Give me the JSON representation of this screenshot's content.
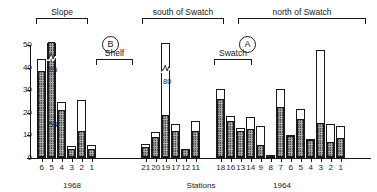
{
  "axes": {
    "ylabel": "× 10³ m⁻²",
    "ylabel_parts": {
      "mult": "×",
      "base": "10",
      "exp": "3",
      "unit": "m",
      "unit_exp": "-2"
    },
    "yticks": [
      0,
      10,
      20,
      30,
      40,
      50
    ],
    "ylim": [
      0,
      50
    ],
    "xlabel": "Stations"
  },
  "era_labels": [
    {
      "text": "1968",
      "x": 72
    },
    {
      "text": "1964",
      "x": 282
    }
  ],
  "panel_letters": [
    {
      "text": "B",
      "x": 102,
      "y": 36
    },
    {
      "text": "A",
      "x": 239,
      "y": 36
    }
  ],
  "brackets": [
    {
      "label": "Slope",
      "x0": 36,
      "x1": 88,
      "y": 18,
      "lab_y": 8
    },
    {
      "label": "Shelf",
      "x0": 96,
      "x1": 133,
      "y": 59,
      "lab_y": 49
    },
    {
      "label": "south of Swatch",
      "x0": 142,
      "x1": 224,
      "y": 18,
      "lab_y": 8
    },
    {
      "label": "Swatch",
      "x0": 214,
      "x1": 252,
      "y": 59,
      "lab_y": 49
    },
    {
      "label": "north of Swatch",
      "x0": 238,
      "x1": 366,
      "y": 18,
      "lab_y": 8
    }
  ],
  "chart_data": {
    "type": "bar",
    "title": "",
    "xlabel": "Stations",
    "ylabel": "× 10³ m⁻²",
    "ylim": [
      0,
      50
    ],
    "yticks": [
      0,
      10,
      20,
      30,
      40,
      50
    ],
    "grid": false,
    "legend": null,
    "note": "Stacked bars: hatched lower segment plus open (white) upper segment. Two bars are axis-broken with printed totals.",
    "series": [
      {
        "name": "hatched (lower segment)",
        "pattern": "cross-hatch"
      },
      {
        "name": "open (upper segment)",
        "pattern": "white"
      }
    ],
    "categories": [
      "6",
      "5",
      "4",
      "3",
      "2",
      "1",
      "21",
      "20",
      "19",
      "17",
      "12",
      "11",
      "18",
      "16",
      "13",
      "14",
      "9",
      "8",
      "7",
      "6",
      "5",
      "4",
      "3",
      "2",
      "1"
    ],
    "groups": [
      {
        "name": "Slope",
        "era": "1968",
        "stations": [
          "6",
          "5",
          "4"
        ]
      },
      {
        "name": "Shelf",
        "era": "1968",
        "stations": [
          "3",
          "2",
          "1"
        ]
      },
      {
        "name": "south of Swatch",
        "era": "mixed",
        "stations": [
          "21",
          "20",
          "19",
          "17",
          "12",
          "11"
        ]
      },
      {
        "name": "Swatch",
        "era": "1964",
        "stations": [
          "18",
          "16",
          "13"
        ]
      },
      {
        "name": "north of Swatch",
        "era": "1964",
        "stations": [
          "14",
          "9",
          "8",
          "7",
          "6",
          "5",
          "4",
          "3",
          "2",
          "1"
        ]
      }
    ],
    "bars": [
      {
        "station": "6",
        "group": "Slope",
        "hatched": 38.0,
        "total": 43.8,
        "open": 5.8,
        "broken": false,
        "label": null
      },
      {
        "station": "5",
        "group": "Slope",
        "hatched": 54.0,
        "total": 85.0,
        "open": 31.0,
        "broken": true,
        "label": "85",
        "inner_label": "54"
      },
      {
        "station": "4",
        "group": "Slope",
        "hatched": 21.0,
        "total": 24.6,
        "open": 3.6,
        "broken": false,
        "label": null
      },
      {
        "station": "3",
        "group": "Shelf",
        "hatched": 3.4,
        "total": 5.4,
        "open": 2.0,
        "broken": false,
        "label": null
      },
      {
        "station": "2",
        "group": "Shelf",
        "hatched": 11.4,
        "total": 25.6,
        "open": 14.2,
        "broken": false,
        "label": null
      },
      {
        "station": "1",
        "group": "Shelf",
        "hatched": 3.7,
        "total": 5.6,
        "open": 1.9,
        "broken": false,
        "label": null
      },
      {
        "station": "21",
        "group": "south of Swatch",
        "hatched": 4.5,
        "total": 6.1,
        "open": 1.6,
        "broken": false,
        "label": null
      },
      {
        "station": "20",
        "group": "south of Swatch",
        "hatched": 8.9,
        "total": 11.3,
        "open": 2.4,
        "broken": false,
        "label": null
      },
      {
        "station": "19",
        "group": "south of Swatch",
        "hatched": 18.6,
        "total": 80.0,
        "open": 61.4,
        "broken": true,
        "label": "80",
        "inner_label": null
      },
      {
        "station": "17",
        "group": "south of Swatch",
        "hatched": 11.6,
        "total": 15.0,
        "open": 3.4,
        "broken": false,
        "label": null
      },
      {
        "station": "12",
        "group": "south of Swatch",
        "hatched": 3.6,
        "total": 3.8,
        "open": 0.2,
        "broken": false,
        "label": null
      },
      {
        "station": "11",
        "group": "south of Swatch",
        "hatched": 11.6,
        "total": 16.2,
        "open": 4.6,
        "broken": false,
        "label": null
      },
      {
        "station": "18",
        "group": "Swatch",
        "hatched": 25.8,
        "total": 30.6,
        "open": 4.8,
        "broken": false,
        "label": null
      },
      {
        "station": "16",
        "group": "Swatch",
        "hatched": 15.8,
        "total": 18.4,
        "open": 2.6,
        "broken": false,
        "label": null
      },
      {
        "station": "13",
        "group": "Swatch",
        "hatched": 11.5,
        "total": 13.2,
        "open": 1.7,
        "broken": false,
        "label": null
      },
      {
        "station": "14",
        "group": "north of Swatch",
        "hatched": 12.3,
        "total": 18.0,
        "open": 5.7,
        "broken": false,
        "label": null
      },
      {
        "station": "9",
        "group": "north of Swatch",
        "hatched": 5.5,
        "total": 14.2,
        "open": 8.7,
        "broken": false,
        "label": null
      },
      {
        "station": "8",
        "group": "north of Swatch",
        "hatched": 0.9,
        "total": 1.4,
        "open": 0.5,
        "broken": false,
        "label": null
      },
      {
        "station": "7",
        "group": "north of Swatch",
        "hatched": 22.0,
        "total": 30.5,
        "open": 8.5,
        "broken": false,
        "label": null
      },
      {
        "station": "6",
        "group": "north of Swatch",
        "hatched": 9.4,
        "total": 10.0,
        "open": 0.6,
        "broken": false,
        "label": null
      },
      {
        "station": "5",
        "group": "north of Swatch",
        "hatched": 16.6,
        "total": 21.5,
        "open": 4.9,
        "broken": false,
        "label": null
      },
      {
        "station": "4",
        "group": "north of Swatch",
        "hatched": 7.6,
        "total": 8.2,
        "open": 0.6,
        "broken": false,
        "label": null
      },
      {
        "station": "3",
        "group": "north of Swatch",
        "hatched": 15.0,
        "total": 47.6,
        "open": 32.6,
        "broken": false,
        "label": null
      },
      {
        "station": "2",
        "group": "north of Swatch",
        "hatched": 6.6,
        "total": 15.2,
        "open": 8.6,
        "broken": false,
        "label": null
      },
      {
        "station": "1",
        "group": "north of Swatch",
        "hatched": 8.2,
        "total": 14.0,
        "open": 5.8,
        "broken": false,
        "label": null
      }
    ]
  },
  "layout": {
    "plot_left": 30,
    "plot_top": 14,
    "plot_width": 341,
    "plot_height": 144,
    "baseline_y": 144,
    "unit_px": 2.26,
    "bar_width": 9.4,
    "bar_x": [
      7,
      17,
      27,
      37,
      47,
      57,
      111,
      121,
      131,
      141,
      151,
      161,
      186,
      196,
      206,
      216,
      226,
      236,
      246,
      256,
      266,
      276,
      286,
      296,
      306
    ]
  }
}
